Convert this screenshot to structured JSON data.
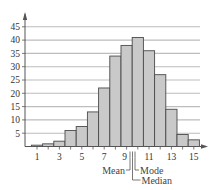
{
  "chart_data": {
    "type": "bar",
    "title": "",
    "xlabel": "",
    "ylabel": "",
    "categories": [
      1,
      2,
      3,
      4,
      5,
      6,
      7,
      8,
      9,
      10,
      11,
      12,
      13,
      14,
      15
    ],
    "values": [
      0.5,
      1,
      2,
      6,
      7.5,
      13,
      22,
      34,
      38,
      41,
      36,
      27,
      14,
      4.5,
      2.5
    ],
    "xtick_labels": [
      "1",
      "3",
      "5",
      "7",
      "9",
      "11",
      "13",
      "15"
    ],
    "xticks": [
      1,
      3,
      5,
      7,
      9,
      11,
      13,
      15
    ],
    "ytick_labels": [
      "5",
      "10",
      "15",
      "20",
      "25",
      "30",
      "35",
      "40",
      "45"
    ],
    "yticks": [
      5,
      10,
      15,
      20,
      25,
      30,
      35,
      40,
      45
    ],
    "ylim": [
      0,
      48
    ],
    "xlim": [
      0.5,
      15.5
    ],
    "grid": true,
    "legend": null,
    "annotations": [
      {
        "label": "Mean",
        "x": 9.1,
        "side": "left"
      },
      {
        "label": "Median",
        "x": 9.3,
        "side": "right"
      },
      {
        "label": "Mode",
        "x": 9.5,
        "side": "right"
      }
    ],
    "colors": {
      "bar_fill": "#c9c9c9",
      "bar_stroke": "#4a4a4a",
      "grid": "#bdbdbd",
      "axis": "#555555",
      "text": "#333333"
    }
  }
}
